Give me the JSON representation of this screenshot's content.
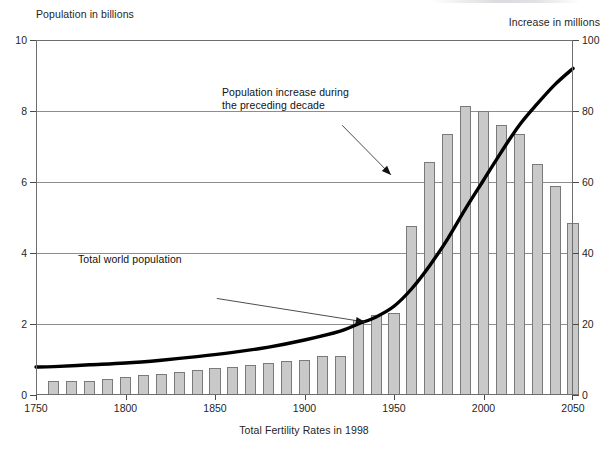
{
  "chart_data": {
    "type": "bar",
    "title": "",
    "xlabel": "Total Fertility Rates in 1998",
    "ylabel": "Population in billions",
    "ylabel_right": "Increase in millions",
    "xlim": [
      1750,
      2050
    ],
    "ylim": [
      0,
      10
    ],
    "ylim_right": [
      0,
      100
    ],
    "grid": true,
    "legend": "none",
    "xticks": [
      1750,
      1800,
      1850,
      1900,
      1950,
      2000,
      2050
    ],
    "xtick_labels": [
      "1750",
      "1800",
      "1850",
      "1900",
      "1950",
      "2000",
      "2050"
    ],
    "yticks_left": [
      0,
      2,
      4,
      6,
      8,
      10
    ],
    "ytick_labels_left": [
      "0",
      "2",
      "4",
      "6",
      "8",
      "10"
    ],
    "yticks_right": [
      0,
      20,
      40,
      60,
      80,
      100
    ],
    "ytick_labels_right": [
      "0",
      "20",
      "40",
      "60",
      "80",
      "100"
    ],
    "series": [
      {
        "name": "Population increase during the preceding decade",
        "type": "bar",
        "axis": "right",
        "unit": "millions",
        "x": [
          1760,
          1770,
          1780,
          1790,
          1800,
          1810,
          1820,
          1830,
          1840,
          1850,
          1860,
          1870,
          1880,
          1890,
          1900,
          1910,
          1920,
          1930,
          1940,
          1950,
          1960,
          1970,
          1980,
          1990,
          2000,
          2010,
          2020,
          2030,
          2040,
          2050
        ],
        "values": [
          4,
          4,
          4,
          4.5,
          5,
          5.5,
          6,
          6.5,
          7,
          7.5,
          8,
          8.5,
          9,
          9.5,
          10,
          11,
          11,
          21,
          22.5,
          23,
          47.5,
          65.5,
          73.5,
          81.5,
          80,
          76,
          73.5,
          65,
          59,
          48.5
        ]
      },
      {
        "name": "Total world population",
        "type": "line",
        "axis": "left",
        "unit": "billions",
        "x": [
          1750,
          1760,
          1780,
          1800,
          1820,
          1840,
          1860,
          1880,
          1900,
          1920,
          1930,
          1940,
          1950,
          1960,
          1970,
          1980,
          1990,
          2000,
          2010,
          2020,
          2030,
          2040,
          2050
        ],
        "values": [
          0.79,
          0.8,
          0.85,
          0.9,
          0.98,
          1.08,
          1.2,
          1.35,
          1.55,
          1.8,
          2.0,
          2.2,
          2.5,
          3.0,
          3.65,
          4.4,
          5.25,
          6.05,
          6.85,
          7.6,
          8.2,
          8.75,
          9.2
        ]
      }
    ],
    "annotations": [
      {
        "name": "increase-annotation",
        "text": "Population increase during\nthe preceding decade",
        "target_x": 1950,
        "target_y_right": 62
      },
      {
        "name": "population-annotation",
        "text": "Total world population",
        "target_x": 1935,
        "target_y_left": 2.0
      }
    ],
    "colors": {
      "bar_fill": "#c9c9c9",
      "bar_edge": "#7a7a7a",
      "line": "#000000",
      "grid": "#8d8d8d",
      "frame": "#6e6e6e",
      "text": "#1a1a1a"
    }
  }
}
